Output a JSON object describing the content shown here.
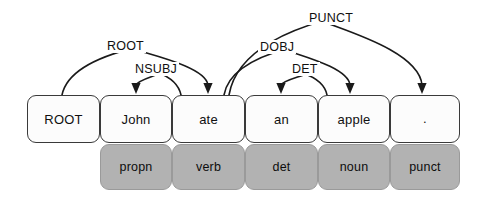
{
  "diagram": {
    "type": "dependency-parse",
    "colors": {
      "word_box_fill": "#fcfcfc",
      "word_box_border": "#3a3a3a",
      "pos_box_fill": "#b2b2b2",
      "pos_box_border": "#9a9a9a",
      "arc_stroke": "#1a1a1a",
      "text": "#101010"
    },
    "tokens": [
      {
        "id": 0,
        "word": "ROOT",
        "pos": "",
        "x": 27,
        "w": 73,
        "has_pos": false
      },
      {
        "id": 1,
        "word": "John",
        "pos": "propn",
        "x": 100,
        "w": 72,
        "has_pos": true
      },
      {
        "id": 2,
        "word": "ate",
        "pos": "verb",
        "x": 172,
        "w": 73,
        "has_pos": true
      },
      {
        "id": 3,
        "word": "an",
        "pos": "det",
        "x": 245,
        "w": 73,
        "has_pos": true
      },
      {
        "id": 4,
        "word": "apple",
        "pos": "noun",
        "x": 318,
        "w": 72,
        "has_pos": true
      },
      {
        "id": 5,
        "word": ".",
        "pos": "punct",
        "x": 390,
        "w": 70,
        "has_pos": true
      }
    ],
    "arcs": [
      {
        "label": "ROOT",
        "head": 0,
        "dep": 2,
        "from_x": 62,
        "to_x": 208,
        "peak_y": 46,
        "label_x": 105,
        "label_y": 39
      },
      {
        "label": "NSUBJ",
        "head": 2,
        "dep": 1,
        "from_x": 181,
        "to_x": 136,
        "peak_y": 72,
        "label_x": 133,
        "label_y": 62
      },
      {
        "label": "DOBJ",
        "head": 2,
        "dep": 4,
        "from_x": 224,
        "to_x": 350,
        "peak_y": 47,
        "label_x": 258,
        "label_y": 40
      },
      {
        "label": "PUNCT",
        "head": 2,
        "dep": 5,
        "from_x": 229,
        "to_x": 422,
        "peak_y": 17,
        "label_x": 307,
        "label_y": 11
      },
      {
        "label": "DET",
        "head": 4,
        "dep": 3,
        "from_x": 327,
        "to_x": 281,
        "peak_y": 73,
        "label_x": 290,
        "label_y": 62
      }
    ],
    "geometry": {
      "word_box_top": 95,
      "word_box_height": 48,
      "pos_box_top": 144,
      "pos_box_height": 46,
      "arrow_tip_y": 95
    }
  }
}
